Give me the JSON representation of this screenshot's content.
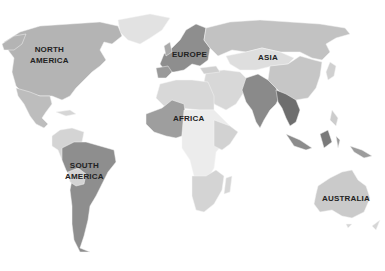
{
  "map": {
    "type": "world-choropleth",
    "colors": {
      "background": "#ffffff",
      "level_light": "#dcdcdc",
      "level_mid_light": "#c8c8c8",
      "level_mid": "#aaaaaa",
      "level_dark": "#8a8a8a",
      "level_darkest": "#6e6e6e",
      "label": "#222222"
    },
    "labels": {
      "north_america_line1": "NORTH",
      "north_america_line2": "AMERICA",
      "europe": "EUROPE",
      "asia": "ASIA",
      "africa": "AFRICA",
      "south_america_line1": "SOUTH",
      "south_america_line2": "AMERICA",
      "australia": "AUSTRALIA"
    }
  }
}
